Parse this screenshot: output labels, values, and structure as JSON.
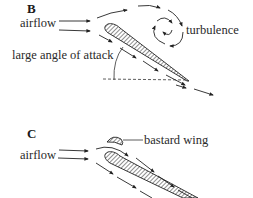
{
  "panels": [
    {
      "id": "B",
      "letter": "B",
      "labels": {
        "airflow": "airflow",
        "turbulence": "turbulence",
        "angle": "large angle of attack"
      }
    },
    {
      "id": "C",
      "letter": "C",
      "labels": {
        "airflow": "airflow",
        "bastard_wing": "bastard wing"
      }
    }
  ],
  "colors": {
    "ink": "#2a2a2a",
    "hatch": "#555555",
    "background": "#ffffff"
  }
}
